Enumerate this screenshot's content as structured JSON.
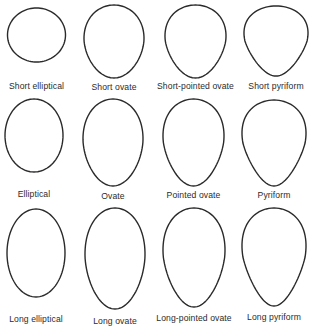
{
  "figure": {
    "rows": [
      {
        "name": "short",
        "shapes": [
          {
            "label": "Short elliptical",
            "cx": 36.5,
            "top": 8,
            "bottom": 62,
            "width": 58,
            "taper": 0.0,
            "label_y": 81
          },
          {
            "label": "Short ovate",
            "cx": 114,
            "top": 5,
            "bottom": 78,
            "width": 60,
            "taper": 0.25,
            "label_y": 82
          },
          {
            "label": "Short-pointed ovate",
            "cx": 195.5,
            "top": 5,
            "bottom": 78,
            "width": 61,
            "taper": 0.45,
            "label_y": 81
          },
          {
            "label": "Short pyriform",
            "cx": 276,
            "top": 6,
            "bottom": 76,
            "width": 64,
            "taper": 0.7,
            "label_y": 81
          }
        ]
      },
      {
        "name": "normal",
        "shapes": [
          {
            "label": "Elliptical",
            "cx": 34,
            "top": 99,
            "bottom": 172,
            "width": 58,
            "taper": 0.0,
            "label_y": 189
          },
          {
            "label": "Ovate",
            "cx": 113,
            "top": 99,
            "bottom": 186,
            "width": 60,
            "taper": 0.25,
            "label_y": 191
          },
          {
            "label": "Pointed ovate",
            "cx": 193.5,
            "top": 99,
            "bottom": 186,
            "width": 61,
            "taper": 0.45,
            "label_y": 190
          },
          {
            "label": "Pyriform",
            "cx": 274,
            "top": 100,
            "bottom": 186,
            "width": 64,
            "taper": 0.7,
            "label_y": 190
          }
        ]
      },
      {
        "name": "long",
        "shapes": [
          {
            "label": "Long elliptical",
            "cx": 36,
            "top": 209,
            "bottom": 297,
            "width": 58,
            "taper": 0.0,
            "label_y": 314
          },
          {
            "label": "Long ovate",
            "cx": 115,
            "top": 208,
            "bottom": 309,
            "width": 60,
            "taper": 0.25,
            "label_y": 316
          },
          {
            "label": "Long-pointed ovate",
            "cx": 194,
            "top": 208,
            "bottom": 307,
            "width": 62,
            "taper": 0.45,
            "label_y": 313
          },
          {
            "label": "Long pyriform",
            "cx": 274,
            "top": 208,
            "bottom": 306,
            "width": 64,
            "taper": 0.7,
            "label_y": 312
          }
        ]
      }
    ],
    "stroke_color": "#2a2a2a",
    "text_color": "#2b2b2b",
    "background": "#ffffff"
  }
}
